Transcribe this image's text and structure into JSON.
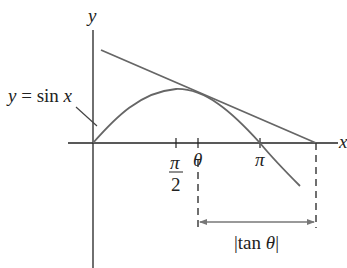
{
  "diagram": {
    "axis_labels": {
      "x": "x",
      "y": "y"
    },
    "curve_label": {
      "lhs": "y",
      "eq": "=",
      "fn": "sin",
      "var": "x"
    },
    "ticks": {
      "pi_over_2": {
        "num": "π",
        "den": "2"
      },
      "theta": "θ",
      "pi": "π"
    },
    "dimension_label": {
      "open": "|",
      "fn": "tan",
      "var": "θ",
      "close": "|"
    },
    "colors": {
      "axes": "#222222",
      "curve": "#666666",
      "tangent": "#666666",
      "dashes": "#333333",
      "arrow": "#777777"
    }
  }
}
